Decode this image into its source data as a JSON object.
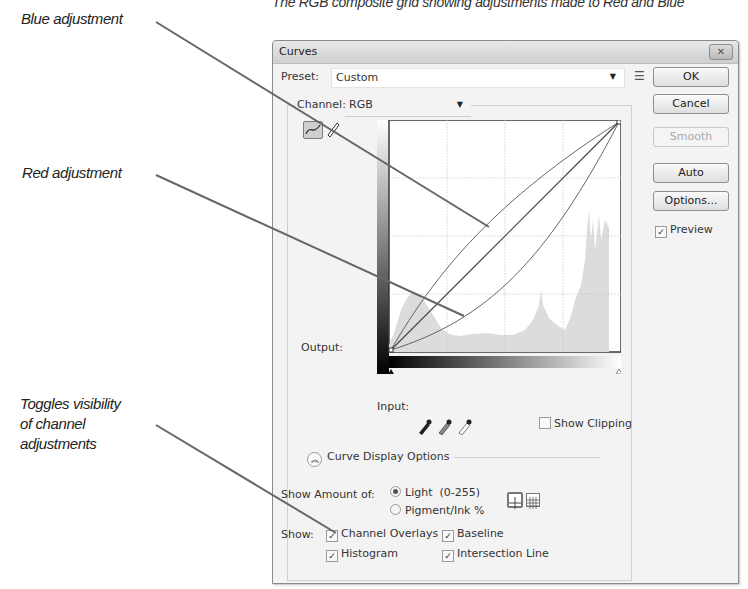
{
  "figure": {
    "caption": "The RGB composite grid showing adjustments made to Red and Blue",
    "annotations": [
      {
        "id": "blue",
        "label": "Blue adjustment"
      },
      {
        "id": "red",
        "label": "Red adjustment"
      },
      {
        "id": "toggle",
        "lines": [
          "Toggles visibility",
          "of channel",
          "adjustments"
        ]
      }
    ]
  },
  "dialog": {
    "title": "Curves",
    "close_icon": "close-icon",
    "preset": {
      "label": "Preset:",
      "value": "Custom",
      "menu_icon": "preset-options-icon"
    },
    "channel": {
      "label": "Channel:",
      "value": "RGB"
    },
    "buttons": {
      "ok": "OK",
      "cancel": "Cancel",
      "smooth": "Smooth",
      "auto": "Auto",
      "options": "Options..."
    },
    "preview": {
      "label": "Preview",
      "checked": true
    },
    "tools": [
      "curve-point-tool-icon",
      "pencil-tool-icon"
    ],
    "graph": {
      "output_label": "Output:",
      "input_label": "Input:",
      "grid_divisions": 4,
      "curves": {
        "composite": "straight diagonal",
        "blue": "bowed above diagonal",
        "red": "bowed below diagonal"
      }
    },
    "eyedroppers": [
      "black-point-eyedropper-icon",
      "gray-point-eyedropper-icon",
      "white-point-eyedropper-icon"
    ],
    "show_clipping": {
      "label": "Show Clipping",
      "checked": false
    },
    "curve_display_options": {
      "label": "Curve Display Options",
      "show_amount_label": "Show Amount of:",
      "amount_options": [
        {
          "label": "Light  (0-255)",
          "selected": true
        },
        {
          "label": "Pigment/Ink %",
          "selected": false
        }
      ],
      "grid_options": [
        "simple-grid-icon",
        "detailed-grid-icon"
      ],
      "show_label": "Show:",
      "show_options": [
        {
          "label": "Channel Overlays",
          "checked": true
        },
        {
          "label": "Baseline",
          "checked": true
        },
        {
          "label": "Histogram",
          "checked": true
        },
        {
          "label": "Intersection Line",
          "checked": true
        }
      ]
    }
  }
}
